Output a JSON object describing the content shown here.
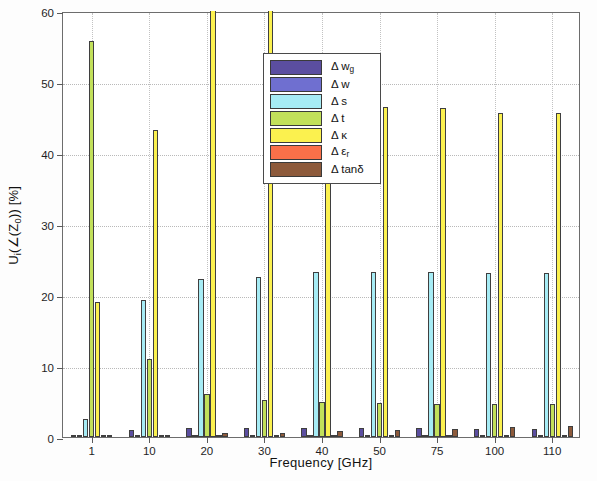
{
  "chart_data": {
    "type": "bar",
    "title": "",
    "xlabel": "Frequency [GHz]",
    "ylabel": "U_i(∠(Z_0)) [%]",
    "ylabel_parts": {
      "prefix": "U",
      "sub1": "i",
      "mid": "(∠(Z",
      "sub2": "0",
      "suffix": ")) [%]"
    },
    "categories": [
      "1",
      "10",
      "20",
      "30",
      "40",
      "50",
      "75",
      "100",
      "110"
    ],
    "xtick_labels": [
      "1",
      "10",
      "20",
      "30",
      "40",
      "50",
      "75",
      "100",
      "110"
    ],
    "ytick_labels": [
      "0",
      "10",
      "20",
      "30",
      "40",
      "50",
      "60"
    ],
    "ytick_values": [
      0,
      10,
      20,
      30,
      40,
      50,
      60
    ],
    "ylim": [
      0,
      60
    ],
    "grid": true,
    "legend_position": "upper-center",
    "series": [
      {
        "name": "Δ w_g",
        "label_main": "Δ w",
        "label_sub": "g",
        "color": "#5b4ea0",
        "values": [
          0.3,
          1.0,
          1.2,
          1.2,
          1.2,
          1.2,
          1.2,
          1.1,
          1.1
        ]
      },
      {
        "name": "Δ w",
        "label_main": "Δ w",
        "label_sub": "",
        "color": "#6f6fd0",
        "values": [
          0.2,
          0.3,
          0.3,
          0.3,
          0.3,
          0.3,
          0.3,
          0.3,
          0.3
        ]
      },
      {
        "name": "Δ s",
        "label_main": "Δ s",
        "label_sub": "",
        "color": "#a6ecf5",
        "values": [
          2.5,
          19.3,
          22.3,
          22.5,
          23.2,
          23.2,
          23.2,
          23.1,
          23.1
        ]
      },
      {
        "name": "Δ t",
        "label_main": "Δ t",
        "label_sub": "",
        "color": "#c2e05a",
        "values": [
          55.8,
          11.0,
          6.0,
          5.2,
          5.0,
          4.8,
          4.6,
          4.6,
          4.6
        ]
      },
      {
        "name": "Δ κ",
        "label_main": "Δ κ",
        "label_sub": "",
        "color": "#fbf14f",
        "values": [
          19.0,
          43.2,
          63.0,
          63.0,
          46.5,
          46.5,
          46.3,
          45.7,
          45.6
        ]
      },
      {
        "name": "Δ ε_r",
        "label_main": "Δ ε",
        "label_sub": "r",
        "color": "#fa7049",
        "values": [
          0.1,
          0.2,
          0.2,
          0.2,
          0.2,
          0.2,
          0.2,
          0.2,
          0.2
        ]
      },
      {
        "name": "Δ tanδ",
        "label_main": "Δ tanδ",
        "label_sub": "",
        "color": "#8d5a3b",
        "values": [
          0.1,
          0.3,
          0.5,
          0.6,
          0.8,
          1.0,
          1.1,
          1.4,
          1.6
        ]
      }
    ]
  }
}
